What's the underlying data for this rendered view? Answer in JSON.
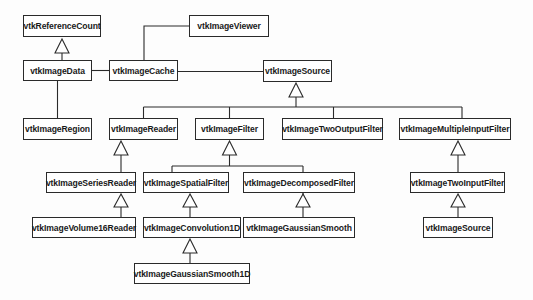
{
  "diagram": {
    "type": "uml-class-inheritance",
    "nodes": [
      {
        "id": "refcount",
        "label": "vtkReferenceCount",
        "x": 23,
        "y": 15,
        "w": 78,
        "h": 22
      },
      {
        "id": "imagedata",
        "label": "vtkImageData",
        "x": 23,
        "y": 60,
        "w": 69,
        "h": 21
      },
      {
        "id": "imagecache",
        "label": "vtkImageCache",
        "x": 109,
        "y": 60,
        "w": 69,
        "h": 21
      },
      {
        "id": "imageviewer",
        "label": "vtkImageViewer",
        "x": 189,
        "y": 15,
        "w": 80,
        "h": 22
      },
      {
        "id": "imagesource",
        "label": "vtkImageSource",
        "x": 263,
        "y": 60,
        "w": 69,
        "h": 21
      },
      {
        "id": "imageregion",
        "label": "vtkImageRegion",
        "x": 23,
        "y": 118,
        "w": 69,
        "h": 22
      },
      {
        "id": "imagereader",
        "label": "vtkImageReader",
        "x": 109,
        "y": 118,
        "w": 69,
        "h": 22
      },
      {
        "id": "imagefilter",
        "label": "vtkImageFilter",
        "x": 195,
        "y": 118,
        "w": 69,
        "h": 22
      },
      {
        "id": "twooutput",
        "label": "vtkImageTwoOutputFilter",
        "x": 282,
        "y": 118,
        "w": 101,
        "h": 22
      },
      {
        "id": "multipleinput",
        "label": "vtkImageMultipleInputFilter",
        "x": 399,
        "y": 118,
        "w": 112,
        "h": 22
      },
      {
        "id": "seriesreader",
        "label": "vtkImageSeriesReader",
        "x": 46,
        "y": 172,
        "w": 90,
        "h": 21
      },
      {
        "id": "spatialfilter",
        "label": "vtkImageSpatialFilter",
        "x": 143,
        "y": 172,
        "w": 86,
        "h": 21
      },
      {
        "id": "decomposed",
        "label": "vtkImageDecomposedFilter",
        "x": 243,
        "y": 172,
        "w": 112,
        "h": 21
      },
      {
        "id": "twoinput",
        "label": "vtkImageTwoInputFilter",
        "x": 410,
        "y": 172,
        "w": 95,
        "h": 21
      },
      {
        "id": "volume16",
        "label": "vtkImageVolume16Reader",
        "x": 32,
        "y": 217,
        "w": 104,
        "h": 21
      },
      {
        "id": "convolution1d",
        "label": "vtkImageConvolution1D",
        "x": 143,
        "y": 217,
        "w": 98,
        "h": 21
      },
      {
        "id": "gaussiansmooth",
        "label": "vtkImageGaussianSmooth",
        "x": 243,
        "y": 217,
        "w": 112,
        "h": 21
      },
      {
        "id": "imagesource2",
        "label": "vtkImageSource",
        "x": 423,
        "y": 217,
        "w": 70,
        "h": 21
      },
      {
        "id": "gaussiansmooth1d",
        "label": "vtkImageGaussianSmooth1D",
        "x": 134,
        "y": 263,
        "w": 116,
        "h": 21
      }
    ],
    "inheritance": [
      {
        "child": "imagedata",
        "parent": "refcount"
      },
      {
        "child": "imagereader",
        "parent": "imagesource"
      },
      {
        "child": "imagefilter",
        "parent": "imagesource"
      },
      {
        "child": "twooutput",
        "parent": "imagesource"
      },
      {
        "child": "multipleinput",
        "parent": "imagesource"
      },
      {
        "child": "seriesreader",
        "parent": "imagereader"
      },
      {
        "child": "volume16",
        "parent": "seriesreader"
      },
      {
        "child": "spatialfilter",
        "parent": "imagefilter"
      },
      {
        "child": "decomposed",
        "parent": "imagefilter"
      },
      {
        "child": "convolution1d",
        "parent": "spatialfilter"
      },
      {
        "child": "gaussiansmooth1d",
        "parent": "convolution1d"
      },
      {
        "child": "gaussiansmooth",
        "parent": "decomposed"
      },
      {
        "child": "twoinput",
        "parent": "multipleinput"
      },
      {
        "child": "imagesource2",
        "parent": "twoinput"
      }
    ],
    "associations": [
      {
        "from": "imagedata",
        "to": "imagecache"
      },
      {
        "from": "imagecache",
        "to": "imageviewer"
      },
      {
        "from": "imagecache",
        "to": "imagesource"
      },
      {
        "from": "imagedata",
        "to": "imageregion"
      }
    ],
    "colors": {
      "line": "#2a2a2a",
      "box_fill": "#ffffff",
      "background": "#fdfdfd",
      "text": "#1a1a1a"
    }
  }
}
